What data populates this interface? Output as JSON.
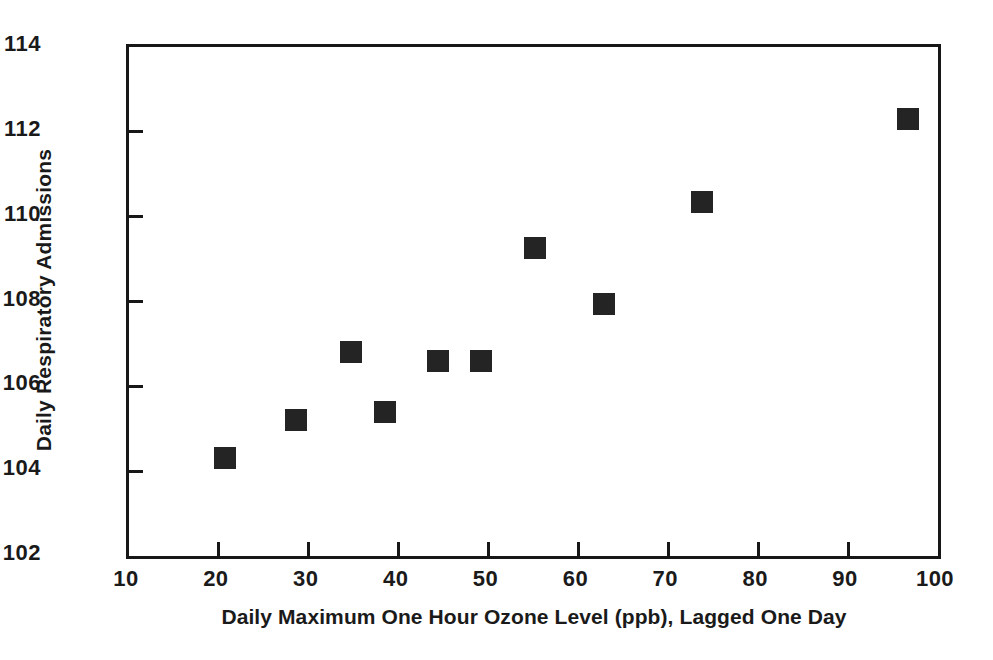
{
  "chart_data": {
    "type": "scatter",
    "title": "",
    "xlabel": "Daily Maximum One Hour Ozone Level (ppb), Lagged One Day",
    "ylabel": "Daily Respiratory Admissions",
    "xlim": [
      10,
      100
    ],
    "ylim": [
      102,
      114
    ],
    "grid": false,
    "legend": null,
    "xticks": [
      10,
      20,
      30,
      40,
      50,
      60,
      70,
      80,
      90,
      100
    ],
    "yticks": [
      102,
      104,
      106,
      108,
      110,
      112,
      114
    ],
    "xtick_labels": [
      "10",
      "20",
      "30",
      "40",
      "50",
      "60",
      "70",
      "80",
      "90",
      "100"
    ],
    "ytick_labels": [
      "102",
      "104",
      "106",
      "108",
      "110",
      "112",
      "114"
    ],
    "marker": "filled-square",
    "marker_color": "#242424",
    "series": [
      {
        "name": "Daily Respiratory Admissions vs Ozone",
        "points": [
          {
            "x": 20.7,
            "y": 104.3
          },
          {
            "x": 28.6,
            "y": 105.2
          },
          {
            "x": 34.7,
            "y": 106.8
          },
          {
            "x": 38.5,
            "y": 105.4
          },
          {
            "x": 44.4,
            "y": 106.6
          },
          {
            "x": 49.2,
            "y": 106.6
          },
          {
            "x": 55.2,
            "y": 109.25
          },
          {
            "x": 62.8,
            "y": 107.95
          },
          {
            "x": 73.8,
            "y": 110.35
          },
          {
            "x": 96.7,
            "y": 112.3
          }
        ]
      }
    ]
  }
}
